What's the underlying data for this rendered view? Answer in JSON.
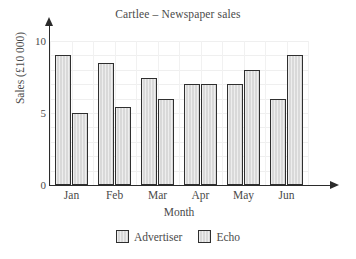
{
  "chart_data": {
    "type": "bar",
    "title": "Cartlee – Newspaper sales",
    "xlabel": "Month",
    "ylabel": "Sales (£10 000)",
    "categories": [
      "Jan",
      "Feb",
      "Mar",
      "Apr",
      "May",
      "Jun"
    ],
    "series": [
      {
        "name": "Advertiser",
        "values": [
          9.0,
          8.5,
          7.4,
          7.0,
          7.0,
          6.0
        ],
        "color": "#d9d9d9"
      },
      {
        "name": "Echo",
        "values": [
          5.0,
          5.4,
          6.0,
          7.0,
          8.0,
          9.0
        ],
        "color": "#d9d9d9"
      }
    ],
    "ylim": [
      0,
      10
    ],
    "yticks": [
      0,
      5,
      10
    ],
    "ytick_labels": [
      "0",
      "5",
      "10"
    ],
    "grid": true,
    "grid_minor_step": 1,
    "legend_position": "bottom"
  },
  "axis_colors": {
    "axis_line": "#2b2b2b",
    "gridline": "#efefef",
    "bar_edge": "#2f2f2f",
    "text": "#4a4a4a"
  }
}
